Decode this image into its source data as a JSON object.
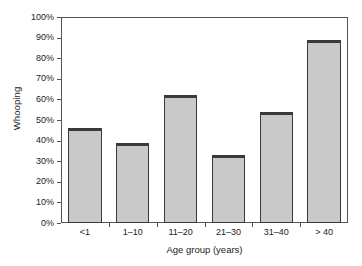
{
  "chart_data": {
    "type": "bar",
    "title": "",
    "xlabel": "Age group (years)",
    "ylabel": "Whooping",
    "categories": [
      "<1",
      "1–10",
      "11–20",
      "21–30",
      "31–40",
      "> 40"
    ],
    "values": [
      46,
      39,
      62,
      33,
      54,
      89
    ],
    "ylim": [
      0,
      100
    ],
    "y_ticks": [
      0,
      10,
      20,
      30,
      40,
      50,
      60,
      70,
      80,
      90,
      100
    ],
    "y_tick_labels": [
      "0%",
      "10%",
      "20%",
      "30%",
      "40%",
      "50%",
      "60%",
      "70%",
      "80%",
      "90%",
      "100%"
    ],
    "value_unit": "%",
    "grid": false,
    "legend": null,
    "legend_position": "none",
    "bar_fill_color": "#c9c9c9",
    "bar_edge_color": "#3a3a3a",
    "axis_color": "#555555",
    "background_color": "#ffffff"
  }
}
